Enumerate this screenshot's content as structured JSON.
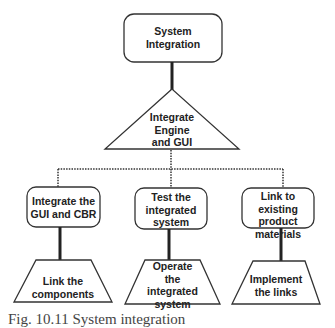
{
  "root": {
    "label": "System\nIntegration"
  },
  "engine": {
    "label": "Integrate\nEngine\nand GUI"
  },
  "branches": [
    {
      "task": "Integrate the\nGUI and CBR",
      "subtask": "Link the\ncomponents"
    },
    {
      "task": "Test the\nintegrated\nsystem",
      "subtask": "Operate\nthe\nintegrated\nsystem"
    },
    {
      "task": "Link to existing\nproduct\nmaterials",
      "subtask": "Implement\nthe links"
    }
  ],
  "caption": "Fig. 10.11 System integration"
}
